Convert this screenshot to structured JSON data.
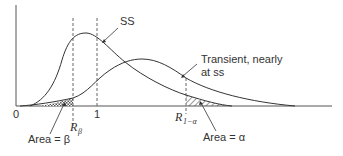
{
  "diagram": {
    "curves": {
      "ss_label": "SS",
      "transient_label_line1": "Transient, nearly",
      "transient_label_line2": "at ss"
    },
    "axis": {
      "tick_zero": "0",
      "tick_one": "1"
    },
    "markers": {
      "r_beta_main": "R",
      "r_beta_sub": "β",
      "r_alpha_main": "R",
      "r_alpha_sub": "1−α"
    },
    "areas": {
      "beta_label": "Area = β",
      "alpha_label": "Area = α"
    },
    "colors": {
      "stroke": "#333333",
      "dashed": "#666666"
    }
  }
}
